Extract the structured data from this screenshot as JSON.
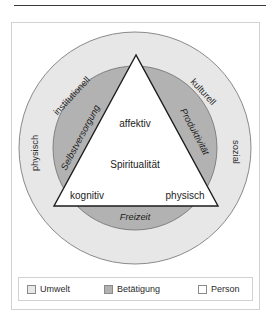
{
  "figure": {
    "title_rule": true,
    "diagram": {
      "type": "venn-triangle-model",
      "colors": {
        "environment_fill": "#e7e7e7",
        "occupation_fill": "#b2b2b2",
        "person_fill": "#ffffff",
        "outline": "#6e6e6e",
        "triangle_outline": "#1c1c1c",
        "text": "#1c1c1c",
        "box_border": "#d2d2d2",
        "top_rule": "#3a3a3a"
      },
      "environment_labels": [
        {
          "id": "institutionell",
          "text": "institutionell"
        },
        {
          "id": "kulturell",
          "text": "kulturell"
        },
        {
          "id": "sozial",
          "text": "sozial"
        },
        {
          "id": "physisch-umwelt",
          "text": "physisch"
        }
      ],
      "occupation_labels": [
        {
          "id": "selbstversorgung",
          "text": "Selbstversorgung"
        },
        {
          "id": "produktivitaet",
          "text": "Produktivität"
        },
        {
          "id": "freizeit",
          "text": "Freizeit"
        }
      ],
      "person_labels": [
        {
          "id": "affektiv",
          "text": "affektiv"
        },
        {
          "id": "kognitiv",
          "text": "kognitiv"
        },
        {
          "id": "physisch-person",
          "text": "physisch"
        },
        {
          "id": "spiritualitaet",
          "text": "Spiritualität"
        }
      ]
    },
    "legend": {
      "items": [
        {
          "id": "umwelt",
          "label": "Umwelt",
          "swatch": "#e7e7e7"
        },
        {
          "id": "betaetigung",
          "label": "Betätigung",
          "swatch": "#b2b2b2"
        },
        {
          "id": "person",
          "label": "Person",
          "swatch": "#ffffff"
        }
      ]
    }
  }
}
